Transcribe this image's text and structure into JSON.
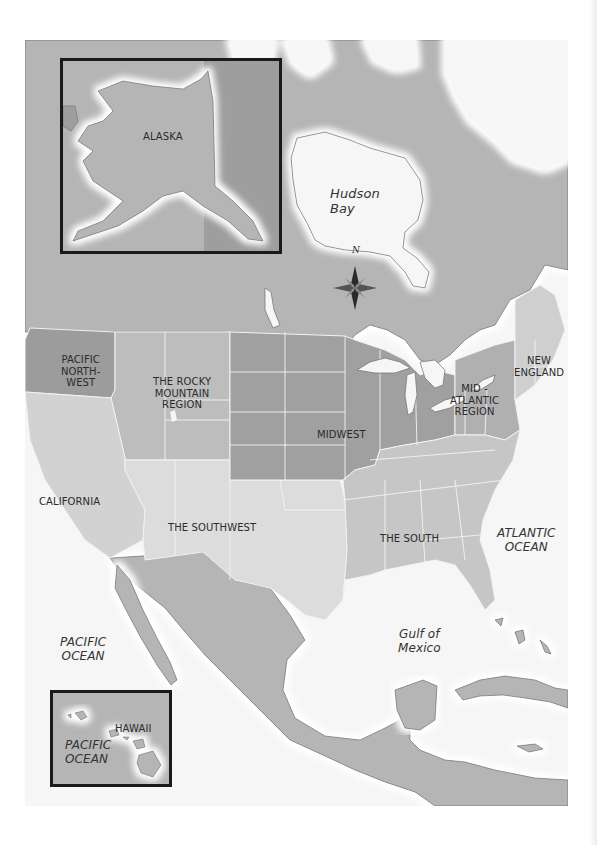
{
  "map": {
    "title_visible": false,
    "colors": {
      "ocean": "#f6f6f6",
      "foreign_land": "#b5b5b5",
      "coast_halo": "#ffffff",
      "border_line": "#6e6e6e",
      "state_line": "#f2f2f2",
      "inset_border": "#1a1a1a",
      "region_pacific_northwest": "#9c9c9c",
      "region_rocky_mountain": "#bdbdbd",
      "region_california": "#d2d2d2",
      "region_southwest": "#dcdcdc",
      "region_midwest": "#a0a0a0",
      "region_south": "#c6c6c6",
      "region_mid_atlantic": "#b0b0b0",
      "region_new_england": "#cfcfcf"
    },
    "compass": {
      "north_label": "N"
    },
    "regions": [
      {
        "id": "pacific-northwest",
        "lines": [
          "PACIFIC",
          "NORTH-",
          "WEST"
        ]
      },
      {
        "id": "rocky-mountain",
        "lines": [
          "THE ROCKY",
          "MOUNTAIN",
          "REGION"
        ]
      },
      {
        "id": "midwest",
        "lines": [
          "MIDWEST"
        ]
      },
      {
        "id": "mid-atlantic",
        "lines": [
          "MID -",
          "ATLANTIC",
          "REGION"
        ]
      },
      {
        "id": "new-england",
        "lines": [
          "NEW",
          "ENGLAND"
        ]
      },
      {
        "id": "california",
        "lines": [
          "CALIFORNIA"
        ]
      },
      {
        "id": "southwest",
        "lines": [
          "THE SOUTHWEST"
        ]
      },
      {
        "id": "south",
        "lines": [
          "THE SOUTH"
        ]
      }
    ],
    "water_bodies": [
      {
        "id": "hudson-bay",
        "lines": [
          "Hudson",
          "Bay"
        ]
      },
      {
        "id": "atlantic-ocean",
        "lines": [
          "ATLANTIC",
          "OCEAN"
        ]
      },
      {
        "id": "gulf-of-mexico",
        "lines": [
          "Gulf of",
          "Mexico"
        ]
      },
      {
        "id": "pacific-ocean",
        "lines": [
          "PACIFIC",
          "OCEAN"
        ]
      }
    ],
    "insets": {
      "alaska": {
        "label": "ALASKA"
      },
      "hawaii": {
        "label": "HAWAII",
        "ocean_lines": [
          "PACIFIC",
          "OCEAN"
        ]
      }
    }
  }
}
